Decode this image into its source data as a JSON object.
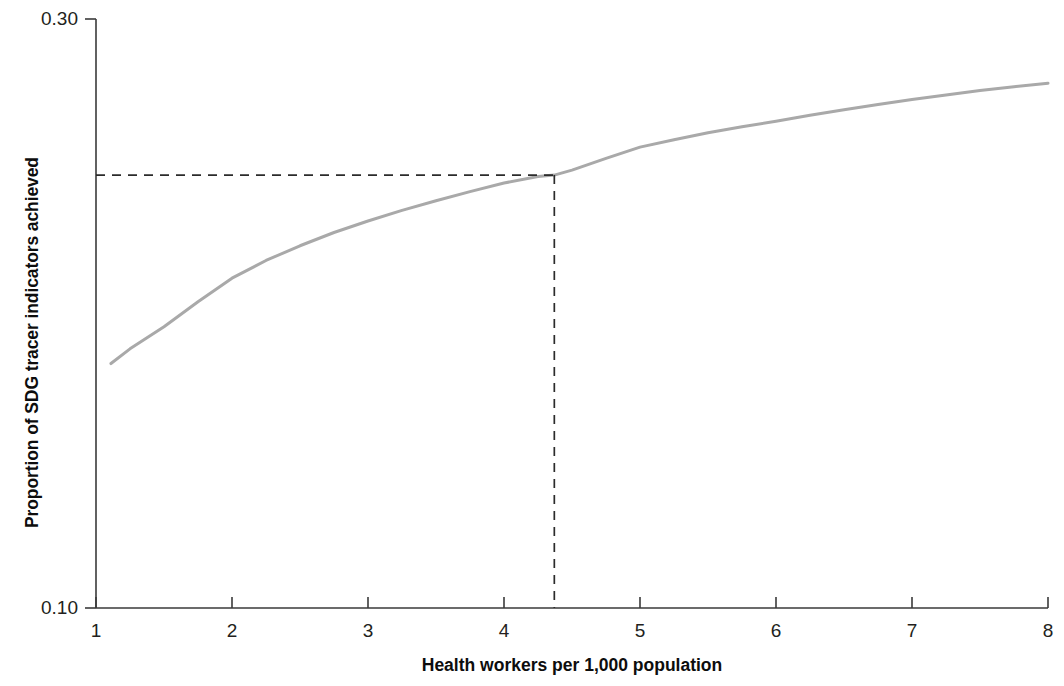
{
  "chart_data": {
    "type": "line",
    "title": "",
    "subtitle": "",
    "xlabel": "Health workers per 1,000 population",
    "ylabel": "Proportion of SDG tracer indicators achieved",
    "xlim": [
      1,
      8
    ],
    "ylim": [
      0.1,
      0.3
    ],
    "xticks": [
      1,
      2,
      3,
      4,
      5,
      6,
      7,
      8
    ],
    "xticklabels": [
      "1",
      "2",
      "3",
      "4",
      "5",
      "6",
      "7",
      "8"
    ],
    "yticks": [
      0.1,
      0.3
    ],
    "yticklabels": [
      "0.10",
      "0.30"
    ],
    "grid": false,
    "legend": null,
    "series": [
      {
        "name": "Proportion of SDG tracer indicators achieved",
        "color": "#a9a9a9",
        "linewidth": 3,
        "x": [
          1.11,
          1.25,
          1.5,
          1.75,
          2.0,
          2.25,
          2.5,
          2.75,
          3.0,
          3.25,
          3.5,
          3.75,
          4.0,
          4.25,
          4.37,
          4.5,
          4.75,
          5.0,
          5.25,
          5.5,
          5.75,
          6.0,
          6.25,
          6.5,
          6.75,
          7.0,
          7.25,
          7.5,
          7.75,
          8.0
        ],
        "y": [
          0.183,
          0.188,
          0.1955,
          0.204,
          0.212,
          0.218,
          0.223,
          0.2275,
          0.2314,
          0.235,
          0.2383,
          0.2414,
          0.2443,
          0.2465,
          0.247,
          0.2487,
          0.2527,
          0.2565,
          0.259,
          0.2614,
          0.2634,
          0.2653,
          0.2673,
          0.2692,
          0.271,
          0.2727,
          0.2742,
          0.2757,
          0.277,
          0.2782
        ]
      }
    ],
    "annotations": [
      {
        "name": "threshold-marker",
        "kind": "dashed-crosshair",
        "x": 4.37,
        "y": 0.247,
        "color": "#2b2b2b",
        "dash": "9 7"
      }
    ],
    "axes": {
      "axis_color": "#3a3a3a",
      "axis_linewidth": 1.6
    }
  }
}
